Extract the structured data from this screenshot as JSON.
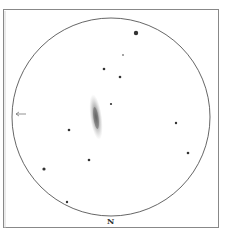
{
  "orientation": {
    "label": "N",
    "position": "bottom"
  },
  "colors": {
    "frame": "#888888",
    "circle": "#555555",
    "star": "#333333",
    "galaxy": "#666666",
    "background": "#ffffff"
  },
  "field": {
    "cx": 111,
    "cy": 117,
    "r": 99
  },
  "frame": {
    "x": 3,
    "y": 9,
    "w": 215,
    "h": 218
  },
  "galaxy": {
    "cx": 96,
    "cy": 117,
    "rx": 5,
    "ry": 22,
    "rotation": -8
  },
  "stars": [
    {
      "x": 136,
      "y": 33,
      "r": 2.2
    },
    {
      "x": 123,
      "y": 55,
      "r": 0.8
    },
    {
      "x": 104,
      "y": 69,
      "r": 1.3
    },
    {
      "x": 120,
      "y": 77,
      "r": 1.3
    },
    {
      "x": 111,
      "y": 104,
      "r": 1.1
    },
    {
      "x": 176,
      "y": 123,
      "r": 1.2
    },
    {
      "x": 188,
      "y": 153,
      "r": 1.3
    },
    {
      "x": 69,
      "y": 130,
      "r": 1.3
    },
    {
      "x": 89,
      "y": 160,
      "r": 1.3
    },
    {
      "x": 44,
      "y": 169,
      "r": 1.6
    },
    {
      "x": 67,
      "y": 202,
      "r": 1.2
    }
  ],
  "arrow": {
    "x": 15,
    "y": 114,
    "direction": "left"
  }
}
